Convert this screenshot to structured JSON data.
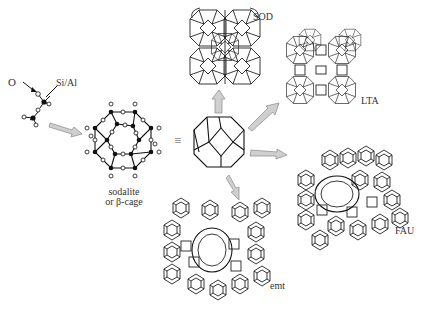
{
  "diagram": {
    "type": "zeolite-building-scheme",
    "tetrahedron": {
      "labels": {
        "oxygen": "O",
        "t_atom": "Si/Al"
      }
    },
    "cage": {
      "label_line1": "sodalite",
      "label_line2": "or β-cage",
      "equivalence_symbol": "≡"
    },
    "frameworks": [
      {
        "id": "sod",
        "label": "SOD"
      },
      {
        "id": "lta",
        "label": "LTA"
      },
      {
        "id": "fau",
        "label": "FAU"
      },
      {
        "id": "emt",
        "label": "emt"
      }
    ],
    "colors": {
      "lines": "#222222",
      "arrows_fill": "#cfcfcf",
      "arrows_stroke": "#888888",
      "background": "#ffffff"
    }
  }
}
